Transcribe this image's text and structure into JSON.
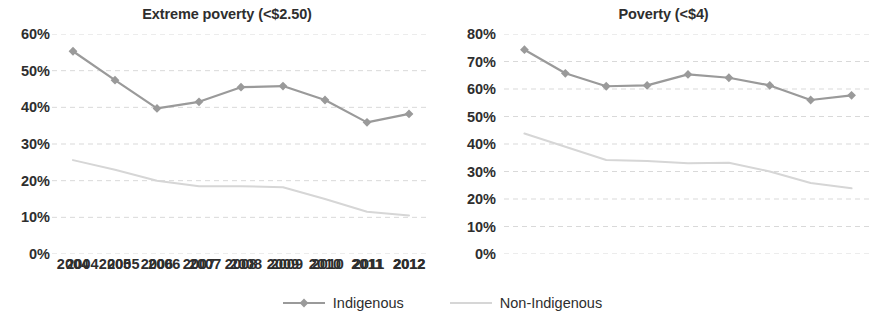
{
  "legend": {
    "items": [
      {
        "label": "Indigenous",
        "color": "#9a9a9a",
        "marker": "diamond"
      },
      {
        "label": "Non-Indigenous",
        "color": "#d6d6d6",
        "marker": "none"
      }
    ]
  },
  "chart_data": [
    {
      "type": "line",
      "title": "Extreme poverty (<$2.50)",
      "xlabel": "",
      "ylabel": "",
      "x": [
        "2004",
        "2005",
        "2006",
        "2007",
        "2008",
        "2009",
        "2010",
        "2011",
        "2012"
      ],
      "categories": [
        "2004",
        "2005",
        "2006",
        "2007",
        "2008",
        "2009",
        "2010",
        "2011",
        "2012"
      ],
      "ylim": [
        0,
        60
      ],
      "yticks": [
        0,
        10,
        20,
        30,
        40,
        50,
        60
      ],
      "ytick_labels": [
        "0%",
        "10%",
        "20%",
        "30%",
        "40%",
        "50%",
        "60%"
      ],
      "grid": true,
      "legend_position": "bottom",
      "series": [
        {
          "name": "Indigenous",
          "color": "#9a9a9a",
          "marker": "diamond",
          "values": [
            55.3,
            47.4,
            39.7,
            41.5,
            45.5,
            45.8,
            42.0,
            35.9,
            38.2
          ]
        },
        {
          "name": "Non-Indigenous",
          "color": "#d6d6d6",
          "marker": "none",
          "values": [
            25.6,
            23.0,
            20.0,
            18.5,
            18.5,
            18.2,
            15.0,
            11.5,
            10.5
          ]
        }
      ]
    },
    {
      "type": "line",
      "title": "Poverty (<$4)",
      "xlabel": "",
      "ylabel": "",
      "x": [
        "2004",
        "2005",
        "2006",
        "2007",
        "2008",
        "2009",
        "2010",
        "2011",
        "2012"
      ],
      "categories": [
        "2004",
        "2005",
        "2006",
        "2007",
        "2008",
        "2009",
        "2010",
        "2011",
        "2012"
      ],
      "ylim": [
        0,
        80
      ],
      "yticks": [
        0,
        10,
        20,
        30,
        40,
        50,
        60,
        70,
        80
      ],
      "ytick_labels": [
        "0%",
        "10%",
        "20%",
        "30%",
        "40%",
        "50%",
        "60%",
        "70%",
        "80%"
      ],
      "grid": true,
      "legend_position": "bottom",
      "series": [
        {
          "name": "Indigenous",
          "color": "#9a9a9a",
          "marker": "diamond",
          "values": [
            74.3,
            65.7,
            61.0,
            61.3,
            65.3,
            64.1,
            61.3,
            56.0,
            57.7
          ]
        },
        {
          "name": "Non-Indigenous",
          "color": "#d6d6d6",
          "marker": "none",
          "values": [
            43.8,
            39.0,
            34.2,
            33.8,
            33.0,
            33.2,
            30.0,
            25.8,
            23.9
          ]
        }
      ]
    }
  ]
}
